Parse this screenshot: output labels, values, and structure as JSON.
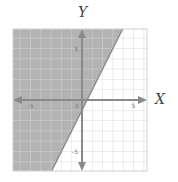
{
  "chart_data": {
    "type": "inequality_plot",
    "title": "",
    "xlabel": "X",
    "ylabel": "Y",
    "xlim": [
      -7,
      7
    ],
    "ylim": [
      -7,
      7
    ],
    "grid": true,
    "grid_step": 1,
    "x_tick_labels": [
      {
        "value": -5,
        "label": "-5"
      },
      {
        "value": 0,
        "label": "0"
      },
      {
        "value": 5,
        "label": "5"
      }
    ],
    "y_tick_labels": [
      {
        "value": 5,
        "label": "5"
      },
      {
        "value": -5,
        "label": "-5"
      }
    ],
    "boundary_line": {
      "slope": 2,
      "intercept": -1,
      "style": "solid",
      "equation": "y = 2x - 1"
    },
    "shaded_region": "left/above boundary",
    "inequality": "y ≥ 2x - 1",
    "colors": {
      "shade": "#b3b3b3",
      "grid": "#d6d6d6",
      "axis": "#8a8a8a",
      "boundary": "#8a8a8a"
    }
  }
}
